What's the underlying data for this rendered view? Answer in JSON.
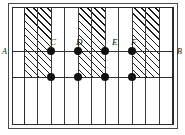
{
  "figure": {
    "type": "geometry-diagram",
    "width": 185,
    "height": 135,
    "background": "#ffffff"
  },
  "frame": {
    "outer": {
      "x": 8,
      "y": 3,
      "w": 170,
      "h": 126,
      "color": "#4a4a4a"
    },
    "inner": {
      "x": 12,
      "y": 7,
      "w": 162,
      "h": 118,
      "color": "#2b2b2b"
    }
  },
  "field": {
    "x": 13,
    "y": 8,
    "w": 160,
    "h": 116
  },
  "hatching": {
    "color": "#1a1a1a",
    "angle_deg": 45,
    "band_top": 0,
    "band_height": 69,
    "bands": [
      {
        "id": "band-1",
        "x": 11,
        "w": 27
      },
      {
        "id": "band-2",
        "x": 65,
        "w": 27
      },
      {
        "id": "band-3",
        "x": 119,
        "w": 27
      }
    ]
  },
  "grid": {
    "vertical_color": "#3a3a3a",
    "vertical_lines": [
      {
        "id": "v0",
        "x": 11
      },
      {
        "id": "v1",
        "x": 24
      },
      {
        "id": "v2",
        "x": 38
      },
      {
        "id": "v3",
        "x": 51
      },
      {
        "id": "v4",
        "x": 65
      },
      {
        "id": "v5",
        "x": 78
      },
      {
        "id": "v6",
        "x": 92
      },
      {
        "id": "v7",
        "x": 105
      },
      {
        "id": "v8",
        "x": 119
      },
      {
        "id": "v9",
        "x": 132
      },
      {
        "id": "v10",
        "x": 146
      },
      {
        "id": "v11",
        "x": 159
      }
    ],
    "horizontal_color": "#2f2f2f",
    "horizontal_lines": [
      {
        "id": "line-AB",
        "y": 43,
        "label_left": "A",
        "label_right": "B"
      },
      {
        "id": "line-lower",
        "y": 69,
        "label_left": "",
        "label_right": ""
      }
    ]
  },
  "points": {
    "color": "#101010",
    "radius_px": 4,
    "upper_row": [
      {
        "id": "point-C",
        "x": 38,
        "y": 43,
        "label": "C"
      },
      {
        "id": "point-D",
        "x": 65,
        "y": 43,
        "label": "D"
      },
      {
        "id": "point-E",
        "x": 92,
        "y": 43,
        "label": "E"
      },
      {
        "id": "point-F",
        "x": 119,
        "y": 43,
        "label": "F"
      }
    ],
    "lower_row": [
      {
        "id": "point-lower-1",
        "x": 38,
        "y": 69,
        "label": ""
      },
      {
        "id": "point-lower-2",
        "x": 65,
        "y": 69,
        "label": ""
      },
      {
        "id": "point-lower-3",
        "x": 92,
        "y": 69,
        "label": ""
      },
      {
        "id": "point-lower-4",
        "x": 119,
        "y": 69,
        "label": ""
      }
    ]
  },
  "labels": {
    "A": "A",
    "B": "B",
    "C": "C",
    "D": "D",
    "E": "E",
    "F": "F"
  }
}
